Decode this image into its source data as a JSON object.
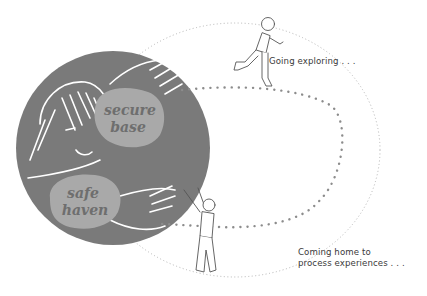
{
  "diagram": {
    "labels": {
      "secure_base_line1": "secure",
      "secure_base_line2": "base",
      "safe_haven_line1": "safe",
      "safe_haven_line2": "haven"
    },
    "captions": {
      "going_exploring": "Going exploring . . .",
      "coming_home_line1": "Coming home to",
      "coming_home_line2": "process experiences . . ."
    },
    "colors": {
      "circle_fill": "#7a7a7a",
      "blob_fill": "#a9a9a9",
      "dots": "#8c8c8c",
      "outline": "#ffffff",
      "figure_stroke": "#555555"
    }
  }
}
